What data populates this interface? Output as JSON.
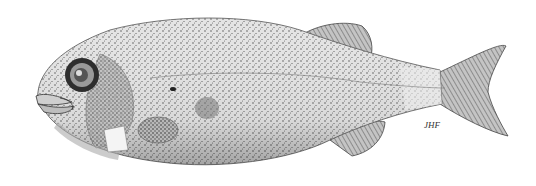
{
  "image": {
    "subject": "Stippled scientific illustration of a fish (lateral view, facing left)",
    "style": "pen-and-ink stipple drawing",
    "background": "#ffffff",
    "ink_color": "#2a2a2a",
    "signature": "JHF"
  }
}
